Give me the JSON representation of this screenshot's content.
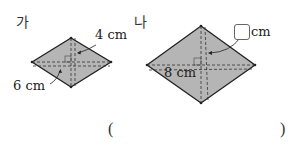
{
  "figures": [
    {
      "label": "가",
      "shape": "rhombus",
      "diagonal_labels": [
        "4 cm",
        "6 cm"
      ]
    },
    {
      "label": "나",
      "shape": "rhombus",
      "diagonal_labels": [
        "8 cm"
      ],
      "answer_box_unit": "cm"
    }
  ],
  "answer": {
    "open_paren": "(",
    "close_paren": ")"
  },
  "colors": {
    "fill": "#b5b5b5",
    "stroke": "#222222"
  }
}
